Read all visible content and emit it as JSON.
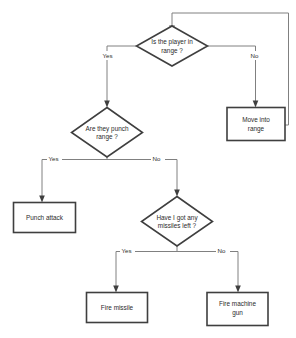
{
  "diagram": {
    "type": "flowchart",
    "colors": {
      "background": "#ffffff",
      "node_border": "#3f3f3f",
      "node_fill": "#ffffff",
      "edge_line": "#808080",
      "text": "#2b2b2b"
    }
  },
  "nodes": {
    "decision_in_range": {
      "shape": "diamond",
      "line1": "Is the player in",
      "line2": "range ?"
    },
    "process_move_into_range": {
      "shape": "rectangle",
      "line1": "Move into",
      "line2": "range"
    },
    "decision_punch_range": {
      "shape": "diamond",
      "line1": "Are they punch",
      "line2": "range ?"
    },
    "process_punch_attack": {
      "shape": "rectangle",
      "line1": "Punch attack",
      "line2": ""
    },
    "decision_missiles_left": {
      "shape": "diamond",
      "line1": "Have I got any",
      "line2": "missiles left ?"
    },
    "process_fire_missile": {
      "shape": "rectangle",
      "line1": "Fire missile",
      "line2": ""
    },
    "process_fire_machine_gun": {
      "shape": "rectangle",
      "line1": "Fire machine",
      "line2": "gun"
    }
  },
  "edge_labels": {
    "in_range_yes": "Yes",
    "in_range_no": "No",
    "punch_yes": "Yes",
    "punch_no": "No",
    "missiles_yes": "Yes",
    "missiles_no": "No"
  }
}
